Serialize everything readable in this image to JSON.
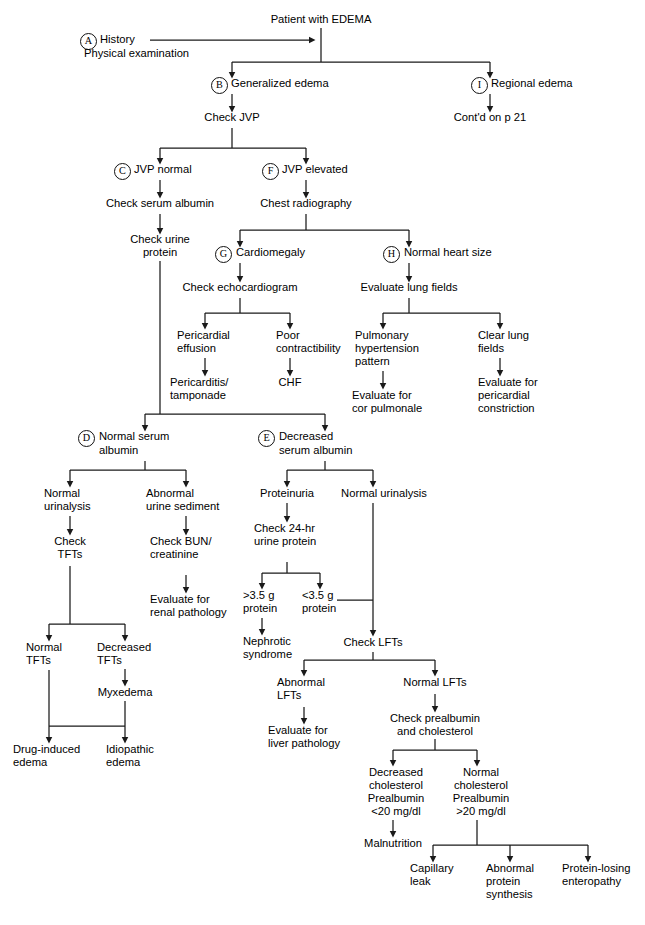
{
  "diagram": {
    "title": "Patient with EDEMA",
    "type": "clinical-algorithm-flowchart",
    "line_color": "#1a1a1a",
    "text_color": "#000000",
    "background": "#ffffff"
  },
  "tags": {
    "a": "A",
    "b": "B",
    "c": "C",
    "d": "D",
    "e": "E",
    "f": "F",
    "g": "G",
    "h": "H",
    "i": "I"
  },
  "nodes": {
    "root": "Patient with EDEMA",
    "history": "History",
    "physical_exam": "Physical examination",
    "generalized_edema": "Generalized edema",
    "regional_edema": "Regional edema",
    "check_jvp": "Check JVP",
    "contd_p21": "Cont'd on p 21",
    "jvp_normal": "JVP normal",
    "jvp_elevated": "JVP elevated",
    "check_serum_albumin": "Check serum albumin",
    "chest_radiography": "Chest radiography",
    "check_urine_protein_l1": "Check urine",
    "check_urine_protein_l2": "protein",
    "cardiomegaly": "Cardiomegaly",
    "normal_heart_size": "Normal heart size",
    "check_echocardiogram": "Check echocardiogram",
    "evaluate_lung_fields": "Evaluate lung fields",
    "pericardial_effusion_l1": "Pericardial",
    "pericardial_effusion_l2": "effusion",
    "poor_contractibility_l1": "Poor",
    "poor_contractibility_l2": "contractibility",
    "pulmonary_htn_l1": "Pulmonary",
    "pulmonary_htn_l2": "hypertension",
    "pulmonary_htn_l3": "pattern",
    "clear_lung_fields_l1": "Clear lung",
    "clear_lung_fields_l2": "fields",
    "pericarditis_l1": "Pericarditis/",
    "pericarditis_l2": "tamponade",
    "chf": "CHF",
    "eval_cor_pulmonale_l1": "Evaluate for",
    "eval_cor_pulmonale_l2": "cor pulmonale",
    "eval_pericardial_constriction_l1": "Evaluate for",
    "eval_pericardial_constriction_l2": "pericardial",
    "eval_pericardial_constriction_l3": "constriction",
    "normal_serum_albumin_l1": "Normal serum",
    "normal_serum_albumin_l2": "albumin",
    "decreased_serum_albumin_l1": "Decreased",
    "decreased_serum_albumin_l2": "serum albumin",
    "normal_urinalysis_l1": "Normal",
    "normal_urinalysis_l2": "urinalysis",
    "abnormal_urine_sediment_l1": "Abnormal",
    "abnormal_urine_sediment_l2": "urine sediment",
    "proteinuria": "Proteinuria",
    "normal_urinalysis_right": "Normal urinalysis",
    "check_tfts_l1": "Check",
    "check_tfts_l2": "TFTs",
    "check_bun_creatinine_l1": "Check BUN/",
    "check_bun_creatinine_l2": "creatinine",
    "check_24hr_urine_protein_l1": "Check 24-hr",
    "check_24hr_urine_protein_l2": "urine protein",
    "eval_renal_pathology_l1": "Evaluate for",
    "eval_renal_pathology_l2": "renal pathology",
    "gt35_protein_l1": ">3.5 g",
    "gt35_protein_l2": "protein",
    "lt35_protein_l1": "<3.5 g",
    "lt35_protein_l2": "protein",
    "normal_tfts_l1": "Normal",
    "normal_tfts_l2": "TFTs",
    "decreased_tfts_l1": "Decreased",
    "decreased_tfts_l2": "TFTs",
    "nephrotic_syndrome_l1": "Nephrotic",
    "nephrotic_syndrome_l2": "syndrome",
    "check_lfts": "Check LFTs",
    "myxedema": "Myxedema",
    "abnormal_lfts_l1": "Abnormal",
    "abnormal_lfts_l2": "LFTs",
    "normal_lfts": "Normal LFTs",
    "check_prealbumin_l1": "Check prealbumin",
    "check_prealbumin_l2": "and cholesterol",
    "eval_liver_pathology_l1": "Evaluate for",
    "eval_liver_pathology_l2": "liver pathology",
    "drug_induced_edema_l1": "Drug-induced",
    "drug_induced_edema_l2": "edema",
    "idiopathic_edema_l1": "Idiopathic",
    "idiopathic_edema_l2": "edema",
    "decreased_chol_l1": "Decreased",
    "decreased_chol_l2": "cholesterol",
    "decreased_chol_l3": "Prealbumin",
    "decreased_chol_l4": "<20 mg/dl",
    "normal_chol_l1": "Normal",
    "normal_chol_l2": "cholesterol",
    "normal_chol_l3": "Prealbumin",
    "normal_chol_l4": ">20 mg/dl",
    "malnutrition": "Malnutrition",
    "capillary_leak_l1": "Capillary",
    "capillary_leak_l2": "leak",
    "abnormal_protein_synthesis_l1": "Abnormal",
    "abnormal_protein_synthesis_l2": "protein",
    "abnormal_protein_synthesis_l3": "synthesis",
    "protein_losing_enteropathy_l1": "Protein-losing",
    "protein_losing_enteropathy_l2": "enteropathy"
  }
}
